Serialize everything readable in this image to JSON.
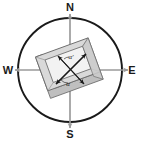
{
  "figure": {
    "name": "compass-orientation-diagram"
  },
  "compass": {
    "north_label": "N",
    "south_label": "S",
    "east_label": "E",
    "west_label": "W",
    "circle_color": "#1a1a1a",
    "axis_color": "#9a9a9a",
    "center_x": 70,
    "center_y": 70,
    "radius": 52
  },
  "frame": {
    "fill_color": "#d9d9d9",
    "inner_fill_color": "#f2f2f2",
    "edge_color": "#6e6e6e",
    "shadow_color": "#b3b3b3",
    "rotation_degrees": 20
  },
  "arrows": {
    "color": "#1a1a1a",
    "diagonal_1_label": "α′",
    "diagonal_2_label": "α"
  }
}
